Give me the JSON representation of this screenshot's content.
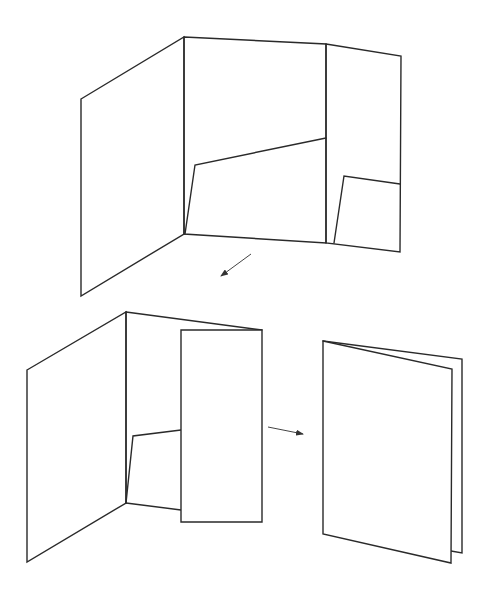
{
  "diagram": {
    "title": "",
    "colors": {
      "stroke": "#2a2a2a",
      "background": "#ffffff"
    },
    "steps": [
      {
        "id": "step-1-open-folder",
        "panels": {
          "left_panel": "81,99 184,37 184,234 81,296",
          "middle_panel": "184,37 326,44 326,243 184,234",
          "right_panel": "326,44 401,56 400,252 326,243",
          "middle_pocket": "185,234 195,165 326,138",
          "right_pocket": "334,243 344,176 400,184"
        }
      },
      {
        "id": "step-2-right-panel-folded",
        "panels": {
          "left_panel": "27,370 126,312 126,503 27,562",
          "middle_panel_top": "126,312 262,330",
          "spine": "126,312 126,503",
          "middle_pocket": "126,503 133,436 181,430",
          "middle_bottom": "126,503 181,510",
          "folded_flap": "181,330 262,330 262,522 181,522"
        }
      },
      {
        "id": "step-3-closed-folder",
        "panels": {
          "back_panel": "323,341 462,359 462,553 451,551",
          "front_panel": "323,341 452,369 451,563 323,534"
        }
      }
    ],
    "arrows": [
      {
        "id": "arrow-step1-to-step2",
        "from": [
          251,
          254
        ],
        "to": [
          221,
          276
        ]
      },
      {
        "id": "arrow-step2-to-step3",
        "from": [
          268,
          427
        ],
        "to": [
          303,
          434
        ]
      }
    ]
  }
}
